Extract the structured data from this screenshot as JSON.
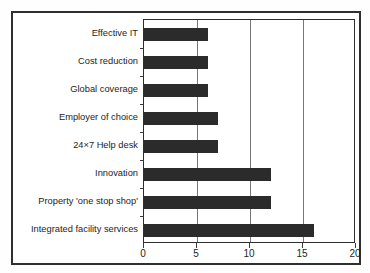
{
  "chart_data": {
    "type": "bar",
    "orientation": "horizontal",
    "title": "",
    "xlabel": "",
    "ylabel": "",
    "xlim": [
      0,
      20
    ],
    "xticks": [
      0,
      5,
      10,
      15,
      20
    ],
    "gridlines": [
      5,
      10,
      15
    ],
    "grid": true,
    "legend": false,
    "bar_color": "#2b2b2b",
    "categories": [
      "Effective IT",
      "Cost reduction",
      "Global coverage",
      "Employer of choice",
      "24×7 Help desk",
      "Innovation",
      "Property 'one stop shop'",
      "Integrated facility services"
    ],
    "values": [
      6,
      6,
      6,
      7,
      7,
      12,
      12,
      16
    ]
  },
  "axis": {
    "tick_labels": [
      "0",
      "5",
      "10",
      "15",
      "20"
    ]
  }
}
